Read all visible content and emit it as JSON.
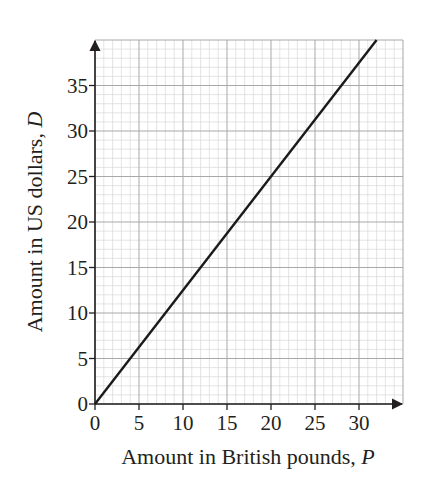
{
  "chart_data": {
    "type": "line",
    "title": "",
    "xlabel": "Amount in British pounds, P",
    "xlabel_text": "Amount in British pounds, ",
    "xlabel_var": "P",
    "ylabel": "Amount in US dollars, D",
    "ylabel_text": "Amount in US dollars, ",
    "ylabel_var": "D",
    "xlim": [
      0,
      35
    ],
    "ylim": [
      0,
      40
    ],
    "x_ticks": [
      0,
      5,
      10,
      15,
      20,
      25,
      30
    ],
    "y_ticks": [
      0,
      5,
      10,
      15,
      20,
      25,
      30,
      35
    ],
    "grid": {
      "minor_step": 1,
      "major_step": 5,
      "on": true
    },
    "legend": null,
    "series": [
      {
        "name": "D = 1.25P",
        "x": [
          0,
          32
        ],
        "y": [
          0,
          40
        ],
        "color": "#1a1a1a"
      }
    ],
    "colors": {
      "line": "#1a1a1a",
      "axis": "#231f20",
      "major_grid": "#a8a8a8",
      "minor_grid": "#d9d9d9"
    }
  }
}
